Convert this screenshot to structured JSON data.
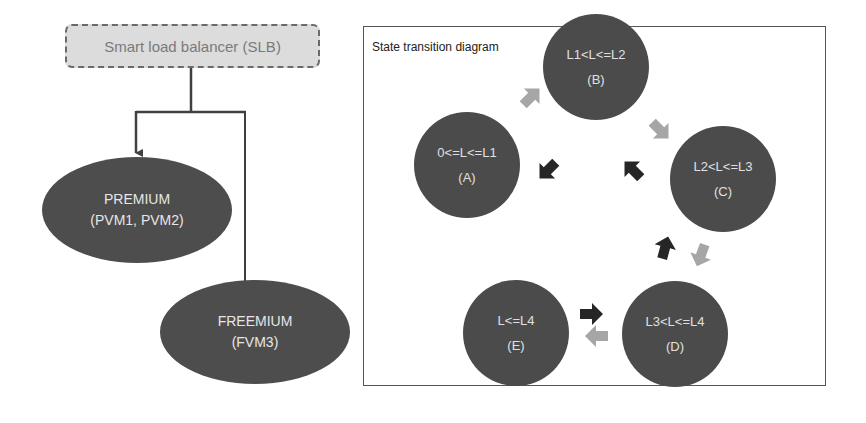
{
  "hierarchy": {
    "root": {
      "label": "Smart load balancer (SLB)"
    },
    "children": [
      {
        "title": "PREMIUM",
        "subtitle": "(PVM1, PVM2)"
      },
      {
        "title": "FREEMIUM",
        "subtitle": "(FVM3)"
      }
    ]
  },
  "state_diagram": {
    "title": "State transition diagram",
    "states": [
      {
        "id": "A",
        "condition": "0<=L<=L1",
        "label": "(A)"
      },
      {
        "id": "B",
        "condition": "L1<L<=L2",
        "label": "(B)"
      },
      {
        "id": "C",
        "condition": "L2<L<=L3",
        "label": "(C)"
      },
      {
        "id": "D",
        "condition": "L3<L<=L4",
        "label": "(D)"
      },
      {
        "id": "E",
        "condition": "L<=L4",
        "label": "(E)"
      }
    ],
    "transitions": [
      {
        "from": "A",
        "to": "B",
        "color": "#a6a6a6"
      },
      {
        "from": "B",
        "to": "C",
        "color": "#a6a6a6"
      },
      {
        "from": "C",
        "to": "D",
        "color": "#a6a6a6"
      },
      {
        "from": "D",
        "to": "E",
        "color": "#a6a6a6"
      },
      {
        "from": "E",
        "to": "D",
        "color": "#262626"
      },
      {
        "from": "D",
        "to": "C",
        "color": "#262626"
      },
      {
        "from": "C",
        "to": "B",
        "color": "#262626"
      },
      {
        "from": "B",
        "to": "A",
        "color": "#262626"
      }
    ]
  },
  "colors": {
    "node_fill": "#4b4b4b",
    "node_text": "#e0e0e0",
    "slb_fill": "#dcdcdc",
    "up_arrow": "#a6a6a6",
    "down_arrow": "#262626"
  }
}
